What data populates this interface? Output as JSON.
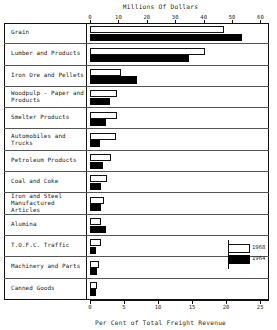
{
  "chart_data": {
    "type": "bar",
    "orientation": "horizontal",
    "title": "",
    "top_axis": {
      "label": "Millions Of Dollars",
      "ticks": [
        0,
        10,
        20,
        30,
        40,
        50,
        60
      ],
      "range": [
        0,
        63
      ]
    },
    "bottom_axis": {
      "label": "Per Cent of Total Freight Revenue",
      "ticks": [
        0,
        5,
        10,
        15,
        20,
        25
      ],
      "range": [
        0,
        26.3
      ]
    },
    "grid": false,
    "legend_position": "inside-lower-right",
    "legend": [
      {
        "name": "1968",
        "swatch": "hollow"
      },
      {
        "name": "1964",
        "swatch": "filled"
      }
    ],
    "categories": [
      "Grain",
      "Lumber and Products",
      "Iron Ore and Pellets",
      "Woodpulp - Paper and Products",
      "Smelter Products",
      "Automobiles and Trucks",
      "Petroleum Products",
      "Coal and Coke",
      "Iron and Steel Manufactured Articles",
      "Alumina",
      "T.O.F.C. Traffic",
      "Machinery and Parts",
      "Canned Goods"
    ],
    "series": [
      {
        "name": "1968",
        "values": [
          47.0,
          40.5,
          11.0,
          9.5,
          9.5,
          9.0,
          7.5,
          6.0,
          5.0,
          4.0,
          4.0,
          3.0,
          2.5
        ]
      },
      {
        "name": "1964",
        "values": [
          53.5,
          35.0,
          16.5,
          7.0,
          5.5,
          3.5,
          4.5,
          4.0,
          4.0,
          5.5,
          2.0,
          2.5,
          2.0
        ]
      }
    ]
  },
  "rows": [
    {
      "label": "Grain"
    },
    {
      "label": "Lumber and Products"
    },
    {
      "label": "Iron Ore and Pellets"
    },
    {
      "label": "Woodpulp - Paper and\nProducts"
    },
    {
      "label": "Smelter Products"
    },
    {
      "label": "Automobiles and Trucks"
    },
    {
      "label": "Petroleum Products"
    },
    {
      "label": "Coal and Coke"
    },
    {
      "label": "Iron and Steel\nManufactured Articles"
    },
    {
      "label": "Alumina"
    },
    {
      "label": "T.O.F.C. Traffic"
    },
    {
      "label": "Machinery and Parts"
    },
    {
      "label": "Canned Goods"
    }
  ]
}
